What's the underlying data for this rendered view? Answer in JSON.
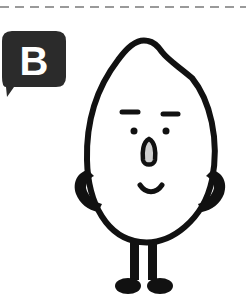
{
  "divider": {
    "style": "dashed",
    "color": "#9a9a9a"
  },
  "badge": {
    "label": "B",
    "background": "#2b2b2b",
    "text_color": "#ffffff",
    "shape": "speech-bubble"
  },
  "illustration": {
    "subject": "rice-grain character",
    "expression": "smiling",
    "pose": "hands on hips",
    "stroke_color": "#111111",
    "fill_color": "#ffffff"
  }
}
